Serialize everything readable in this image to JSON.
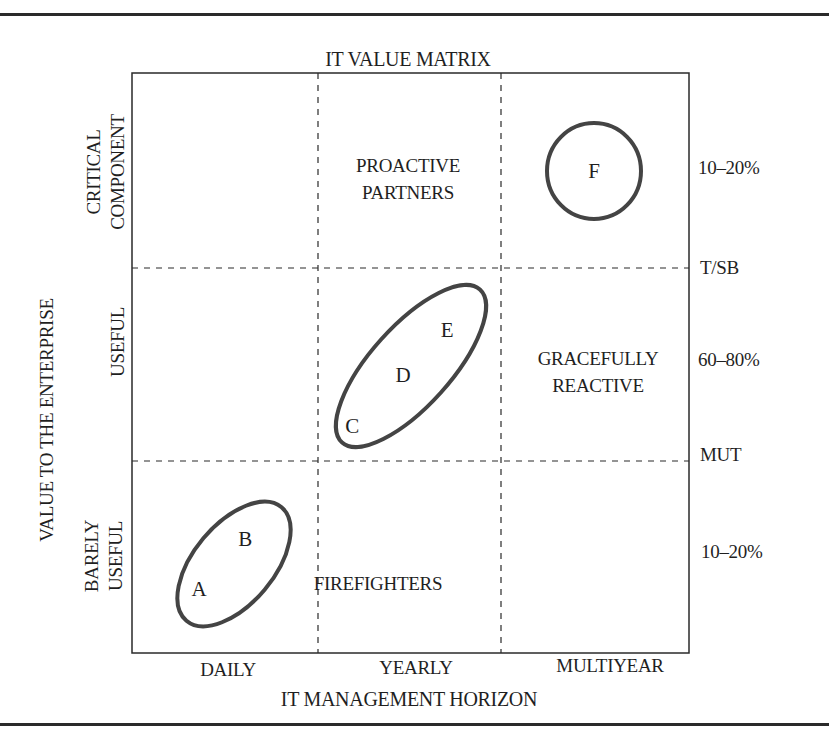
{
  "title": "IT VALUE MATRIX",
  "x_axis": {
    "label": "IT MANAGEMENT HORIZON",
    "ticks": [
      "DAILY",
      "YEARLY",
      "MULTIYEAR"
    ]
  },
  "y_axis": {
    "label": "VALUE TO THE ENTERPRISE",
    "ticks": [
      {
        "line1": "CRITICAL",
        "line2": "COMPONENT"
      },
      {
        "line1": "USEFUL",
        "line2": ""
      },
      {
        "line1": "BARELY",
        "line2": "USEFUL"
      }
    ]
  },
  "right_labels": {
    "top_pct": "10–20%",
    "boundary_top": "T/SB",
    "middle_pct": "60–80%",
    "boundary_bottom": "MUT",
    "bottom_pct": "10–20%"
  },
  "quadrant_labels": {
    "proactive": {
      "line1": "PROACTIVE",
      "line2": "PARTNERS"
    },
    "graceful": {
      "line1": "GRACEFULLY",
      "line2": "REACTIVE"
    },
    "firefighters": "FIREFIGHTERS"
  },
  "points": {
    "A": "A",
    "B": "B",
    "C": "C",
    "D": "D",
    "E": "E",
    "F": "F"
  },
  "colors": {
    "line": "#2a2a2a",
    "ellipse": "#444444",
    "text": "#1f1f1f"
  }
}
